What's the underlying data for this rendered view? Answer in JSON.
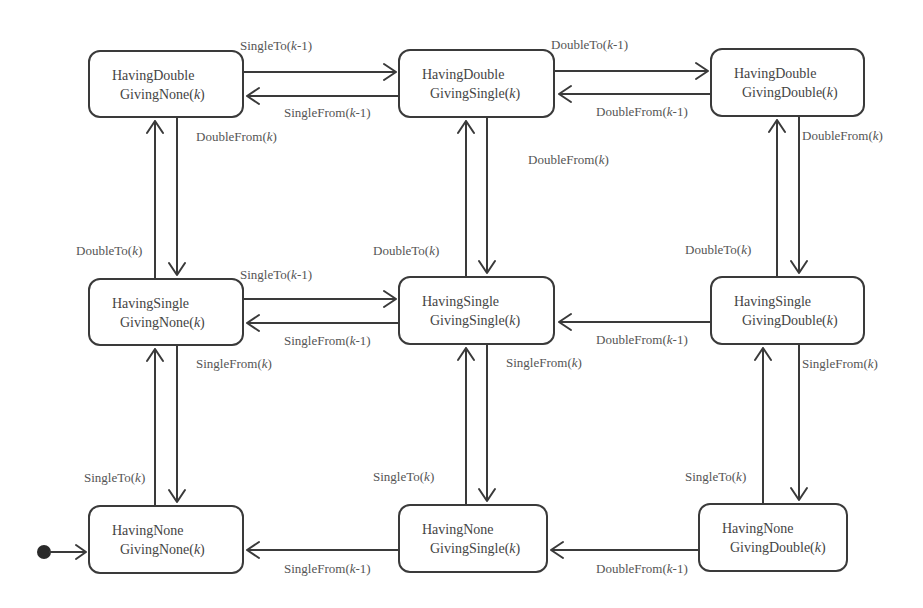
{
  "diagram": {
    "type": "state-machine",
    "colors": {
      "stroke": "#3a3a3a",
      "text": "#444444",
      "background": "#ffffff"
    },
    "initial_state": "HavingNone GivingNone(k)",
    "states": [
      {
        "id": "s_dn",
        "line1": "HavingDouble",
        "line2": "GivingNone(k)"
      },
      {
        "id": "s_ds",
        "line1": "HavingDouble",
        "line2": "GivingSingle(k)"
      },
      {
        "id": "s_dd",
        "line1": "HavingDouble",
        "line2": "GivingDouble(k)"
      },
      {
        "id": "s_sn",
        "line1": "HavingSingle",
        "line2": "GivingNone(k)"
      },
      {
        "id": "s_ss",
        "line1": "HavingSingle",
        "line2": "GivingSingle(k)"
      },
      {
        "id": "s_sd",
        "line1": "HavingSingle",
        "line2": "GivingDouble(k)"
      },
      {
        "id": "s_nn",
        "line1": "HavingNone",
        "line2": "GivingNone(k)"
      },
      {
        "id": "s_ns",
        "line1": "HavingNone",
        "line2": "GivingSingle(k)"
      },
      {
        "id": "s_nd",
        "line1": "HavingNone",
        "line2": "GivingDouble(k)"
      }
    ],
    "transitions": [
      {
        "from": "s_dn",
        "to": "s_ds",
        "label": "SingleTo(k-1)"
      },
      {
        "from": "s_ds",
        "to": "s_dn",
        "label": "SingleFrom(k-1)"
      },
      {
        "from": "s_ds",
        "to": "s_dd",
        "label": "DoubleTo(k-1)"
      },
      {
        "from": "s_dd",
        "to": "s_ds",
        "label": "DoubleFrom(k-1)"
      },
      {
        "from": "s_dn",
        "to": "s_sn",
        "label": "DoubleFrom(k)"
      },
      {
        "from": "s_sn",
        "to": "s_dn",
        "label": "DoubleTo(k)"
      },
      {
        "from": "s_ds",
        "to": "s_ss",
        "label": "DoubleFrom(k)"
      },
      {
        "from": "s_ss",
        "to": "s_ds",
        "label": "DoubleTo(k)"
      },
      {
        "from": "s_dd",
        "to": "s_sd",
        "label": "DoubleFrom(k)"
      },
      {
        "from": "s_sd",
        "to": "s_dd",
        "label": "DoubleTo(k)"
      },
      {
        "from": "s_sn",
        "to": "s_ss",
        "label": "SingleTo(k-1)"
      },
      {
        "from": "s_ss",
        "to": "s_sn",
        "label": "SingleFrom(k-1)"
      },
      {
        "from": "s_sd",
        "to": "s_ss",
        "label": "DoubleFrom(k-1)"
      },
      {
        "from": "s_sn",
        "to": "s_nn",
        "label": "SingleFrom(k)"
      },
      {
        "from": "s_nn",
        "to": "s_sn",
        "label": "SingleTo(k)"
      },
      {
        "from": "s_ss",
        "to": "s_ns",
        "label": "SingleFrom(k)"
      },
      {
        "from": "s_ns",
        "to": "s_ss",
        "label": "SingleTo(k)"
      },
      {
        "from": "s_sd",
        "to": "s_nd",
        "label": "SingleFrom(k)"
      },
      {
        "from": "s_nd",
        "to": "s_sd",
        "label": "SingleTo(k)"
      },
      {
        "from": "s_ns",
        "to": "s_nn",
        "label": "SingleFrom(k-1)"
      },
      {
        "from": "s_nd",
        "to": "s_ns",
        "label": "DoubleFrom(k-1)"
      }
    ]
  }
}
